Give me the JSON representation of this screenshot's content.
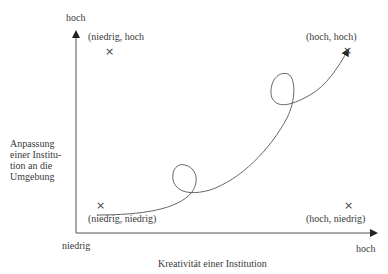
{
  "diagram": {
    "type": "quadrant-trajectory",
    "x_axis": {
      "label": "Kreativität einer Institution",
      "low_label": "niedrig",
      "high_label": "hoch"
    },
    "y_axis": {
      "label": "Anpassung einer Institu- tion an die Umgebung",
      "label_lines": [
        "Anpassung",
        "einer Institu-",
        "tion an die",
        "Umgebung"
      ],
      "high_label": "hoch"
    },
    "points": [
      {
        "label": "(niedrig, hoch",
        "marker": "×"
      },
      {
        "label": "(hoch, hoch)",
        "marker": "×"
      },
      {
        "label": "(niedrig, niedrig)",
        "marker": "×"
      },
      {
        "label": "(hoch, niedrig)",
        "marker": "×"
      }
    ],
    "trajectory": {
      "description": "curved arrow from low-low region toward high-high with two loops",
      "loops": 2
    },
    "colors": {
      "line": "#555555",
      "text": "#3a3a3a",
      "background": "#ffffff"
    }
  }
}
